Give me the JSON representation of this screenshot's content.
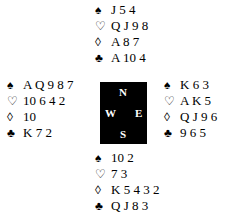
{
  "suits": {
    "spades": "♠",
    "hearts": "♡",
    "diamonds": "◊",
    "clubs": "♣"
  },
  "north": {
    "spades": "J 5 4",
    "hearts": "Q J 9 8",
    "diamonds": "A 8 7",
    "clubs": "A 10 4"
  },
  "west": {
    "spades": "A Q 9 8 7",
    "hearts": "10 6 4 2",
    "diamonds": "10",
    "clubs": "K 7 2"
  },
  "east": {
    "spades": "K 6 3",
    "hearts": "A K 5",
    "diamonds": "Q J 9 6",
    "clubs": "9 6 5"
  },
  "south": {
    "spades": "10 2",
    "hearts": "7 3",
    "diamonds": "K 5 4 3 2",
    "clubs": "Q J 8 3"
  },
  "compass": {
    "n": "N",
    "s": "S",
    "e": "E",
    "w": "W"
  }
}
